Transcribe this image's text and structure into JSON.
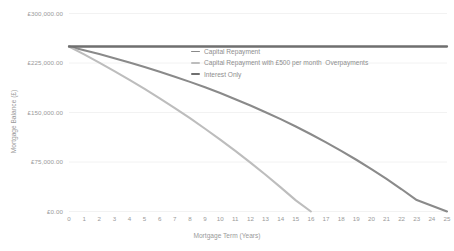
{
  "chart_data": {
    "type": "line",
    "title": "",
    "xlabel": "Mortgage Term (Years)",
    "ylabel": "Mortgage Balance (£)",
    "xlim": [
      0,
      25
    ],
    "ylim": [
      0,
      300000
    ],
    "grid": true,
    "legend_position": "upper center inside",
    "x": [
      0,
      1,
      2,
      3,
      4,
      5,
      6,
      7,
      8,
      9,
      10,
      11,
      12,
      13,
      14,
      15,
      16,
      17,
      18,
      19,
      20,
      21,
      22,
      23,
      24,
      25
    ],
    "xticks": [
      "0",
      "1",
      "2",
      "3",
      "4",
      "5",
      "6",
      "7",
      "8",
      "9",
      "10",
      "11",
      "12",
      "13",
      "14",
      "15",
      "16",
      "17",
      "18",
      "19",
      "20",
      "21",
      "22",
      "23",
      "24",
      "25"
    ],
    "yticks": [
      0,
      75000,
      150000,
      225000,
      300000
    ],
    "ytick_labels": [
      "£0.00",
      "£75,000.00",
      "£150,000.00",
      "£225,000.00",
      "£300,000.00"
    ],
    "series": [
      {
        "name": "Capital Repayment",
        "color": "#8a8a8a",
        "width": 2.1,
        "values": [
          250000,
          244400,
          238500,
          232300,
          225800,
          219000,
          211800,
          204300,
          196400,
          188100,
          179400,
          170200,
          160600,
          150500,
          139900,
          128800,
          117100,
          104800,
          91900,
          78400,
          64200,
          49300,
          33700,
          17300,
          8700,
          0
        ]
      },
      {
        "name": "Capital Repayment with £500 per month  Overpayments",
        "color": "#bdbdbd",
        "width": 2.1,
        "values": [
          250000,
          238000,
          225600,
          212800,
          199500,
          185700,
          171400,
          156600,
          141300,
          125400,
          108900,
          91800,
          74100,
          55700,
          36600,
          16800,
          0,
          null,
          null,
          null,
          null,
          null,
          null,
          null,
          null,
          null
        ]
      },
      {
        "name": "Interest Only",
        "color": "#6f6f6f",
        "width": 2.3,
        "values": [
          250000,
          250000,
          250000,
          250000,
          250000,
          250000,
          250000,
          250000,
          250000,
          250000,
          250000,
          250000,
          250000,
          250000,
          250000,
          250000,
          250000,
          250000,
          250000,
          250000,
          250000,
          250000,
          250000,
          250000,
          250000,
          250000
        ]
      }
    ],
    "overpayment_payoff_year": 15.8,
    "gridline_color": "#f2f2f2",
    "background_color": "#ffffff",
    "tick_label_color": "#9a9a9a"
  },
  "legend": {
    "items": [
      {
        "label": "Capital Repayment"
      },
      {
        "label": "Capital Repayment with £500 per month  Overpayments"
      },
      {
        "label": "Interest Only"
      }
    ]
  }
}
